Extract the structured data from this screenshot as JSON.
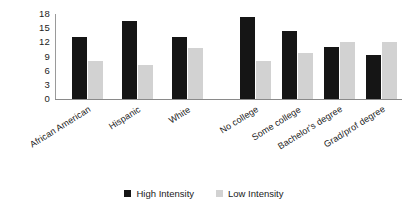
{
  "chart_data": {
    "type": "bar",
    "title": "",
    "xlabel": "",
    "ylabel": "",
    "ylim": [
      0,
      18
    ],
    "yticks": [
      0,
      3,
      6,
      9,
      12,
      15,
      18
    ],
    "grid": false,
    "legend_position": "bottom-center",
    "categories": [
      "African American",
      "Hispanic",
      "White",
      "No college",
      "Some college",
      "Bachelor's degree",
      "Grad/prof degree"
    ],
    "panels": [
      {
        "name": "race",
        "categories": [
          "African American",
          "Hispanic",
          "White"
        ]
      },
      {
        "name": "education",
        "categories": [
          "No college",
          "Some college",
          "Bachelor's degree",
          "Grad/prof degree"
        ]
      }
    ],
    "series": [
      {
        "name": "High Intensity",
        "color": "#151515",
        "values": [
          13.2,
          16.5,
          13.2,
          17.3,
          14.3,
          11.1,
          9.3
        ]
      },
      {
        "name": "Low Intensity",
        "color": "#d2d2d2",
        "values": [
          8.0,
          7.3,
          10.8,
          8.0,
          9.7,
          12.0,
          12.1
        ]
      }
    ]
  },
  "legend": {
    "items": [
      {
        "label": "High Intensity",
        "color": "#151515"
      },
      {
        "label": "Low Intensity",
        "color": "#d2d2d2"
      }
    ]
  }
}
